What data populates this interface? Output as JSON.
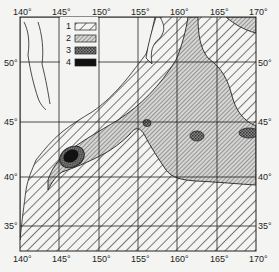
{
  "map": {
    "type": "thematic zone map",
    "region": "Northwest Pacific",
    "lon_labels_top": [
      "140°",
      "145°",
      "150°",
      "155°",
      "160°",
      "165°",
      "170°"
    ],
    "lon_labels_bottom": [
      "140°",
      "145°",
      "150°",
      "155°",
      "160°",
      "165°",
      "170°"
    ],
    "lat_labels_left": [
      "50°",
      "45°",
      "40°",
      "35°"
    ],
    "lat_labels_right": [
      "50°",
      "45°",
      "40°",
      "35°"
    ],
    "lon_range": [
      140,
      170
    ],
    "lat_range": [
      33,
      53
    ],
    "grid": true
  },
  "legend": {
    "items": [
      {
        "label": "1",
        "pattern": "sparse-diagonal-hatch"
      },
      {
        "label": "2",
        "pattern": "dense-diagonal-hatch"
      },
      {
        "label": "3",
        "pattern": "crosshatch-dots"
      },
      {
        "label": "4",
        "pattern": "solid-black"
      }
    ]
  },
  "colors": {
    "background": "#f4f4f2",
    "ink": "#222222",
    "land": "#f4f4f2"
  }
}
